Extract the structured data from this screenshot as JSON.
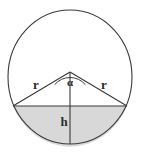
{
  "figure": {
    "background_color": "#ffffff",
    "stroke_color": "#3a3a3a",
    "segment_fill_color": "#d8d8d8",
    "label_color": "#2b2b2b"
  },
  "chart_data": {
    "type": "diagram",
    "shapes": [
      {
        "name": "outer-circle",
        "kind": "ellipse",
        "cx": 70,
        "cy": 77,
        "rx": 62,
        "ry": 67,
        "fill": "none",
        "stroke": "#3a3a3a"
      },
      {
        "name": "shaded-circular-segment",
        "kind": "segment",
        "chord_y": 106,
        "chord_x1": 13,
        "chord_x2": 127,
        "fill": "#d8d8d8",
        "stroke": "#3a3a3a"
      },
      {
        "name": "radius-left",
        "kind": "line",
        "x1": 70,
        "y1": 72,
        "x2": 13,
        "y2": 106,
        "stroke": "#3a3a3a"
      },
      {
        "name": "radius-right",
        "kind": "line",
        "x1": 70,
        "y1": 72,
        "x2": 127,
        "y2": 106,
        "stroke": "#3a3a3a"
      },
      {
        "name": "height-line",
        "kind": "line",
        "x1": 70,
        "y1": 72,
        "x2": 70,
        "y2": 144,
        "stroke": "#3a3a3a"
      },
      {
        "name": "angle-arc",
        "kind": "arc",
        "cx": 70,
        "cy": 72,
        "radius": 20,
        "stroke": "#3a3a3a"
      }
    ],
    "annotations": [
      {
        "name": "radius-left-label",
        "text": "r",
        "x": 36,
        "y": 89
      },
      {
        "name": "central-angle-label",
        "text": "α",
        "x": 70,
        "y": 86
      },
      {
        "name": "radius-right-label",
        "text": "r",
        "x": 104,
        "y": 89
      },
      {
        "name": "segment-height-label",
        "text": "h",
        "x": 64,
        "y": 126
      }
    ]
  },
  "labels": {
    "radius_left": "r",
    "radius_right": "r",
    "central_angle": "α",
    "segment_height": "h"
  }
}
